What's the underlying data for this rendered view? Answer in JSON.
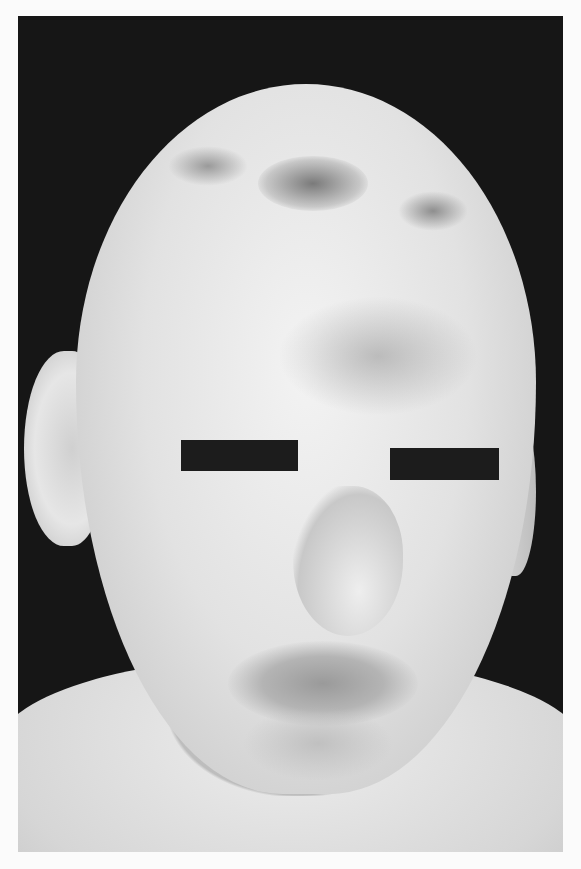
{
  "image": {
    "kind": "grayscale clinical photograph",
    "frame": {
      "x": 18,
      "y": 16,
      "width": 545,
      "height": 836
    },
    "background_color": "#161616",
    "page_color": "#fbfbfb",
    "subject": "bald child's face with scattered dark skin spots, eyes covered by black censor bars",
    "censor_bars": [
      {
        "x": 181,
        "y": 440,
        "width": 117,
        "height": 31
      },
      {
        "x": 390,
        "y": 448,
        "width": 109,
        "height": 32
      }
    ]
  }
}
